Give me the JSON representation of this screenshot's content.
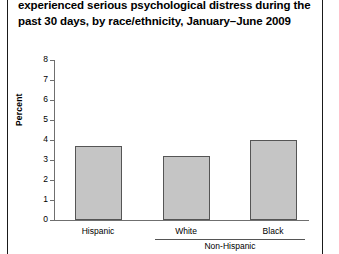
{
  "figure": {
    "title": "experienced serious psychological distress during the past 30\ndays, by race/ethnicity, January–June 2009",
    "page_rules": true
  },
  "chart_data": {
    "type": "bar",
    "title": "experienced serious psychological distress during the past 30 days, by race/ethnicity, January–June 2009",
    "categories": [
      "Hispanic",
      "White",
      "Black"
    ],
    "values": [
      3.7,
      3.2,
      4.0
    ],
    "group_bracket": {
      "label": "Non-Hispanic",
      "covers": [
        "White",
        "Black"
      ]
    },
    "xlabel": "",
    "ylabel": "Percent",
    "ylim": [
      0,
      8
    ],
    "yticks": [
      0,
      1,
      2,
      3,
      4,
      5,
      6,
      7,
      8
    ],
    "ytick_labels": [
      "0",
      "1",
      "2",
      "3",
      "4",
      "5",
      "6",
      "7",
      "8"
    ],
    "grid": false,
    "legend": null,
    "bar_color": "#c5c5c5",
    "bar_edge_color": "#555555",
    "axis_color": "#6f6f6f"
  }
}
